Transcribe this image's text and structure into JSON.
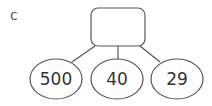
{
  "label": "c",
  "top_box": {
    "value": ""
  },
  "leaves": [
    {
      "value": "500",
      "cx": 56
    },
    {
      "value": "40",
      "cx": 117
    },
    {
      "value": "29",
      "cx": 177
    }
  ],
  "colors": {
    "stroke": "#555555",
    "text": "#333333"
  }
}
